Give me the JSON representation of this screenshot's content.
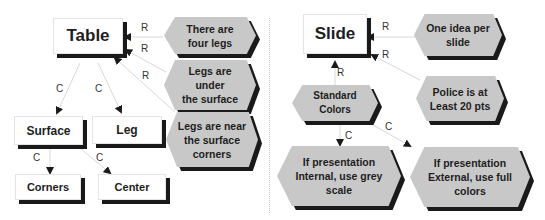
{
  "left_diagram": {
    "root": "Table",
    "children": [
      "Surface",
      "Leg"
    ],
    "grandchildren": [
      "Corners",
      "Center"
    ],
    "rules": [
      "There are\nfour legs",
      "Legs are\nunder\nthe surface",
      "Legs are near\nthe surface\ncorners"
    ]
  },
  "right_diagram": {
    "root": "Slide",
    "rules": [
      "One idea per\nslide",
      "Police is at\nLeast 20 pts"
    ],
    "child": "Standard\nColors",
    "grandchildren": [
      "If presentation\nInternal, use grey\nscale",
      "If presentation\nExternal, use full\ncolors"
    ]
  },
  "edge_labels": {
    "rule": "R",
    "child": "C"
  },
  "colors": {
    "hex_fill": "#c8c8c8",
    "shadow": "#1a1a1a",
    "box_fill": "#ffffff",
    "link": "#d8d8d8"
  }
}
